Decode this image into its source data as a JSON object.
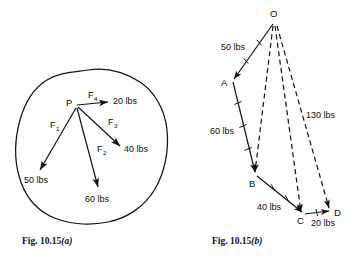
{
  "figure_a": {
    "caption_prefix": "Fig. ",
    "caption_number": "10.15",
    "caption_letter": "(a)",
    "point_label": "P",
    "outline_name": "irregular-body-outline",
    "forces": [
      {
        "name": "F1",
        "symbol": "F",
        "subscript": "1",
        "magnitude": "50 lbs",
        "direction": "lower-left"
      },
      {
        "name": "F2",
        "symbol": "F",
        "subscript": "2",
        "magnitude": "60 lbs",
        "direction": "down"
      },
      {
        "name": "F3",
        "symbol": "F",
        "subscript": "3",
        "magnitude": "40 lbs",
        "direction": "lower-right"
      },
      {
        "name": "F4",
        "symbol": "F",
        "subscript": "4",
        "magnitude": "20 lbs",
        "direction": "right"
      }
    ]
  },
  "figure_b": {
    "caption_prefix": "Fig. ",
    "caption_number": "10.15",
    "caption_letter": "(b)",
    "vertices": [
      {
        "label": "O"
      },
      {
        "label": "A"
      },
      {
        "label": "B"
      },
      {
        "label": "C"
      },
      {
        "label": "D"
      }
    ],
    "segments": [
      {
        "name": "OA",
        "magnitude": "50 lbs",
        "style": "solid"
      },
      {
        "name": "AB",
        "magnitude": "60 lbs",
        "style": "solid"
      },
      {
        "name": "BC",
        "magnitude": "40 lbs",
        "style": "solid"
      },
      {
        "name": "CD",
        "magnitude": "20 lbs",
        "style": "solid"
      },
      {
        "name": "OD",
        "magnitude": "130 lbs",
        "style": "dashed"
      },
      {
        "name": "OB",
        "magnitude": "",
        "style": "dashed"
      },
      {
        "name": "OC",
        "magnitude": "",
        "style": "dashed"
      }
    ]
  },
  "colors": {
    "ink": "#121212",
    "background": "#ffffff"
  }
}
